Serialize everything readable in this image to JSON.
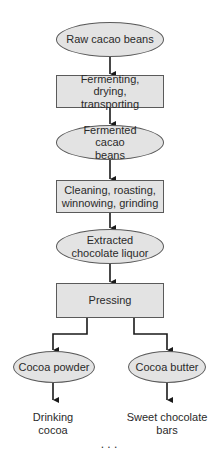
{
  "diagram": {
    "type": "flowchart",
    "colors": {
      "fill": "#e3e3e3",
      "border": "#5a5a5a",
      "arrow": "#1a1a1a",
      "text": "#2a2a2a"
    },
    "nodes": [
      {
        "id": "raw",
        "shape": "ellipse",
        "label": "Raw cacao beans"
      },
      {
        "id": "ferm_step",
        "shape": "rect",
        "label": "Fermenting, drying, transporting"
      },
      {
        "id": "fermented",
        "shape": "ellipse",
        "label": "Fermented cacao beans"
      },
      {
        "id": "clean_step",
        "shape": "rect",
        "label": "Cleaning, roasting, winnowing, grinding"
      },
      {
        "id": "liquor",
        "shape": "ellipse",
        "label": "Extracted chocolate liquor"
      },
      {
        "id": "pressing",
        "shape": "rect",
        "label": "Pressing"
      },
      {
        "id": "powder",
        "shape": "ellipse",
        "label": "Cocoa powder"
      },
      {
        "id": "butter",
        "shape": "ellipse",
        "label": "Cocoa butter"
      }
    ],
    "outputs": [
      {
        "id": "drinking",
        "label": "Drinking cocoa"
      },
      {
        "id": "sweet",
        "label": "Sweet chocolate bars"
      }
    ],
    "edges": [
      [
        "raw",
        "ferm_step"
      ],
      [
        "ferm_step",
        "fermented"
      ],
      [
        "fermented",
        "clean_step"
      ],
      [
        "clean_step",
        "liquor"
      ],
      [
        "liquor",
        "pressing"
      ],
      [
        "pressing",
        "powder"
      ],
      [
        "pressing",
        "butter"
      ],
      [
        "powder",
        "drinking"
      ],
      [
        "butter",
        "sweet"
      ]
    ],
    "caption_cut_off": ". . ."
  }
}
